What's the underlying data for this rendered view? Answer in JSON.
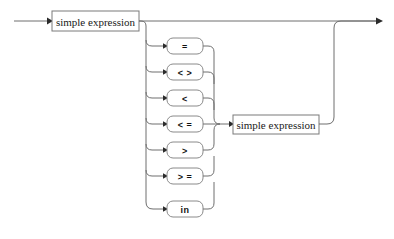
{
  "diagram": {
    "kind": "railroad-syntax-diagram",
    "title": "expression",
    "background_color": "#ffffff",
    "line_color": "#6e6e6e",
    "box_stroke_color": "#7a7a7a",
    "text_color": "#1a1a1a",
    "entry_arrow": "arrow-right",
    "exit_arrow": "arrow-right",
    "nonterminals": [
      {
        "id": "left-simple-expression",
        "label": "simple expression"
      },
      {
        "id": "right-simple-expression",
        "label": "simple expression"
      }
    ],
    "operators": [
      {
        "id": "op-eq",
        "label": "="
      },
      {
        "id": "op-ne",
        "label": "< >"
      },
      {
        "id": "op-lt",
        "label": "<"
      },
      {
        "id": "op-le",
        "label": "< ="
      },
      {
        "id": "op-gt",
        "label": ">"
      },
      {
        "id": "op-ge",
        "label": "> ="
      },
      {
        "id": "op-in",
        "label": "in"
      }
    ],
    "paths": {
      "bypass_label": "skip comparison",
      "branch_label": "comparison operator choice"
    }
  }
}
